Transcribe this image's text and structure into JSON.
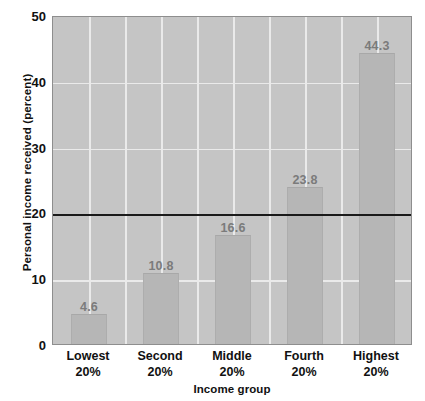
{
  "chart_data": {
    "type": "bar",
    "title": "",
    "xlabel": "Income group",
    "ylabel": "Personal income received (percent)",
    "categories": [
      "Lowest\n20%",
      "Second\n20%",
      "Middle\n20%",
      "Fourth\n20%",
      "Highest\n20%"
    ],
    "category_lines": [
      {
        "line1": "Lowest",
        "line2": "20%"
      },
      {
        "line1": "Second",
        "line2": "20%"
      },
      {
        "line1": "Middle",
        "line2": "20%"
      },
      {
        "line1": "Fourth",
        "line2": "20%"
      },
      {
        "line1": "Highest",
        "line2": "20%"
      }
    ],
    "values": [
      4.6,
      10.8,
      16.6,
      23.8,
      44.3
    ],
    "value_labels": [
      "4.6",
      "10.8",
      "16.6",
      "23.8",
      "44.3"
    ],
    "ylim": [
      0,
      50
    ],
    "yticks": [
      0,
      10,
      20,
      30,
      40,
      50
    ],
    "ytick_labels": [
      "0",
      "10",
      "20",
      "30",
      "40",
      "50"
    ],
    "grid": true,
    "gridlines_horizontal": [
      10,
      30,
      40
    ],
    "vertical_grid_count": 10,
    "legend": null,
    "reference_line": {
      "value": 20,
      "color": "#1a1a1a",
      "label": ""
    },
    "colors": {
      "plot_background": "#c5c5c5",
      "bar_fill": "#b6b6b6",
      "grid": "#eaeaea",
      "axis_text": "#111111",
      "value_label": "#7b7b7b",
      "reference_line": "#1a1a1a",
      "plot_border": "#8e8e8e",
      "page_background": "#ffffff"
    }
  }
}
